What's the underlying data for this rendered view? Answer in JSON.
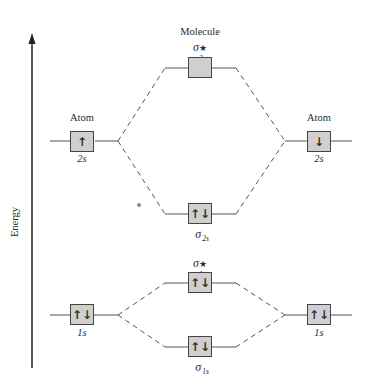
{
  "title": "Molecule",
  "axis": {
    "label": "Energy",
    "direction": "up"
  },
  "colors": {
    "box_fill": "#cfcfcf",
    "line": "#444444",
    "text": "#2b2b2b"
  },
  "atoms": {
    "left": {
      "heading": "Atom",
      "orbitals": [
        {
          "name": "2s",
          "electrons": "up",
          "glyph": "↑"
        },
        {
          "name": "1s",
          "electrons": "paired",
          "glyph": "↑↓"
        }
      ]
    },
    "right": {
      "heading": "Atom",
      "orbitals": [
        {
          "name": "2s",
          "electrons": "down",
          "glyph": "↓"
        },
        {
          "name": "1s",
          "electrons": "paired",
          "glyph": "↑↓"
        }
      ]
    }
  },
  "molecular_orbitals": [
    {
      "symbol": "σ",
      "subscript": "2s",
      "antibonding": true,
      "star": "★",
      "electrons": "empty",
      "glyph": ""
    },
    {
      "symbol": "σ",
      "subscript": "2s",
      "antibonding": false,
      "star": "",
      "electrons": "paired",
      "glyph": "↑↓"
    },
    {
      "symbol": "σ",
      "subscript": "1s",
      "antibonding": true,
      "star": "★",
      "electrons": "paired",
      "glyph": "↑↓"
    },
    {
      "symbol": "σ",
      "subscript": "1s",
      "antibonding": false,
      "star": "",
      "electrons": "paired",
      "glyph": "↑↓"
    }
  ]
}
